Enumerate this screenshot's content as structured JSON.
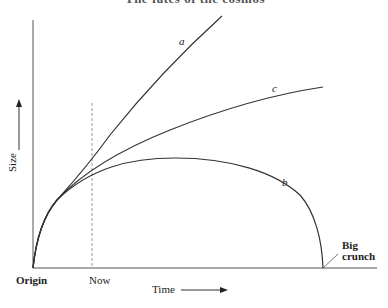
{
  "diagram": {
    "title_partial": "The fates of the cosmos",
    "axes": {
      "x_label": "Time",
      "y_label": "Size"
    },
    "markers": {
      "origin": "Origin",
      "now": "Now",
      "big_crunch_line1": "Big",
      "big_crunch_line2": "crunch"
    },
    "curves": [
      {
        "id": "a",
        "label": "a",
        "description": "ever-accelerating expansion"
      },
      {
        "id": "c",
        "label": "c",
        "description": "decelerating expansion"
      },
      {
        "id": "b",
        "label": "b",
        "description": "expansion then recollapse to big crunch"
      }
    ],
    "colors": {
      "line": "#333333",
      "dashed": "#999999",
      "background": "#ffffff"
    }
  }
}
